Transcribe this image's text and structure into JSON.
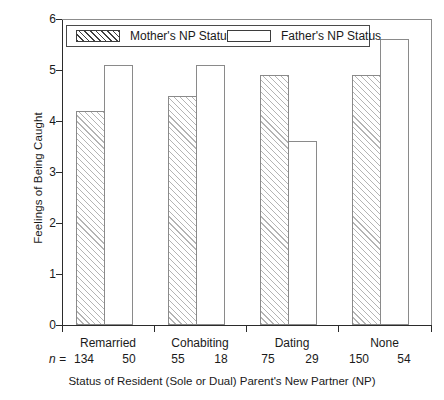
{
  "chart_data": {
    "type": "bar",
    "title": "",
    "xlabel": "Status of Resident (Sole or Dual) Parent's New Partner (NP)",
    "ylabel": "Feelings of Being Caught",
    "ylim": [
      0,
      6
    ],
    "ytick_labels": [
      "0",
      "1",
      "2",
      "3",
      "4",
      "5",
      "6"
    ],
    "grid": false,
    "legend_position": "top-left-inside",
    "categories": [
      "Remarried",
      "Cohabiting",
      "Dating",
      "None"
    ],
    "series": [
      {
        "name": "Mother's NP Status",
        "style": "hatched",
        "values": [
          4.2,
          4.5,
          4.9,
          4.9
        ],
        "n": [
          134,
          55,
          75,
          150
        ]
      },
      {
        "name": "Father's NP Status",
        "style": "open",
        "values": [
          5.1,
          5.1,
          3.6,
          5.6
        ],
        "n": [
          50,
          18,
          29,
          54
        ]
      }
    ],
    "n_row_prefix": "n =",
    "n_values": [
      [
        "134",
        "50"
      ],
      [
        "55",
        "18"
      ],
      [
        "75",
        "29"
      ],
      [
        "150",
        "54"
      ]
    ]
  },
  "axis": {
    "y_title": "Feelings of Being Caught",
    "x_title": "Status of Resident (Sole or Dual) Parent's New Partner (NP)",
    "y_ticks": [
      "6",
      "5",
      "4",
      "3",
      "2",
      "1",
      "0"
    ]
  },
  "legend": {
    "entries": [
      {
        "label": "Mother's NP Status"
      },
      {
        "label": "Father's NP Status"
      }
    ]
  },
  "colors": {
    "axis": "#2b2b2b",
    "bar_outline": "#8a8a8a",
    "hatch": "#b4b4b4",
    "frame": "#8c8c8c",
    "background": "#ffffff"
  }
}
